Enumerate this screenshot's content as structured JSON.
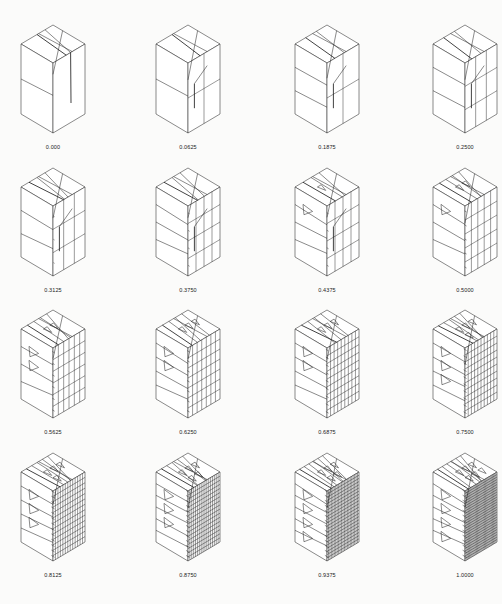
{
  "figure": {
    "line_color": "#2b2b2b",
    "background": "#fbfbfa",
    "panels": [
      {
        "label": "0.000",
        "t": 0.0,
        "row": 0,
        "col": 0
      },
      {
        "label": "0.0625",
        "t": 0.0625,
        "row": 0,
        "col": 1
      },
      {
        "label": "0.1875",
        "t": 0.1875,
        "row": 0,
        "col": 2
      },
      {
        "label": "0.2500",
        "t": 0.25,
        "row": 0,
        "col": 3
      },
      {
        "label": "0.3125",
        "t": 0.3125,
        "row": 1,
        "col": 0
      },
      {
        "label": "0.3750",
        "t": 0.375,
        "row": 1,
        "col": 1
      },
      {
        "label": "0.4375",
        "t": 0.4375,
        "row": 1,
        "col": 2
      },
      {
        "label": "0.5000",
        "t": 0.5,
        "row": 1,
        "col": 3
      },
      {
        "label": "0.5625",
        "t": 0.5625,
        "row": 2,
        "col": 0
      },
      {
        "label": "0.6250",
        "t": 0.625,
        "row": 2,
        "col": 1
      },
      {
        "label": "0.6875",
        "t": 0.6875,
        "row": 2,
        "col": 2
      },
      {
        "label": "0.7500",
        "t": 0.75,
        "row": 2,
        "col": 3
      },
      {
        "label": "0.8125",
        "t": 0.8125,
        "row": 3,
        "col": 0
      },
      {
        "label": "0.8750",
        "t": 0.875,
        "row": 3,
        "col": 1
      },
      {
        "label": "0.9375",
        "t": 0.9375,
        "row": 3,
        "col": 2
      },
      {
        "label": "1.0000",
        "t": 1.0,
        "row": 3,
        "col": 3
      }
    ]
  }
}
